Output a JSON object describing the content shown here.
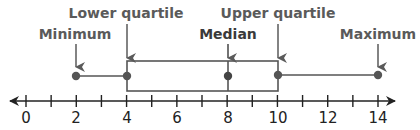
{
  "chart_data": {
    "type": "boxplot",
    "title": "",
    "five_number_summary": {
      "minimum": 2,
      "lower_quartile": 4,
      "median": 8,
      "upper_quartile": 10,
      "maximum": 14
    },
    "axis": {
      "min": 0,
      "max": 14,
      "major_tick_step": 2,
      "minor_tick_step": 1,
      "tick_labels": [
        "0",
        "2",
        "4",
        "6",
        "8",
        "10",
        "12",
        "14"
      ],
      "arrows_both_ends": true
    },
    "annotations": [
      {
        "text": "Minimum",
        "points_to": 2
      },
      {
        "text": "Lower quartile",
        "points_to": 4
      },
      {
        "text": "Median",
        "points_to": 8
      },
      {
        "text": "Upper quartile",
        "points_to": 10
      },
      {
        "text": "Maximum",
        "points_to": 14
      }
    ]
  },
  "labels": {
    "minimum": "Minimum",
    "lower_quartile": "Lower quartile",
    "median": "Median",
    "upper_quartile": "Upper quartile",
    "maximum": "Maximum"
  },
  "ticks": [
    "0",
    "2",
    "4",
    "6",
    "8",
    "10",
    "12",
    "14"
  ],
  "colors": {
    "box_stroke": "#555555",
    "point_fill": "#555555",
    "axis": "#222222",
    "label_text": "#5a5a5a"
  }
}
